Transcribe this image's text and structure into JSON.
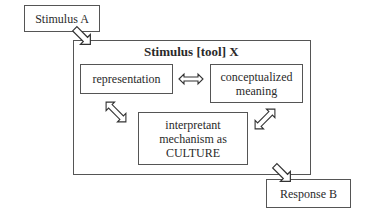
{
  "diagram": {
    "stimulus_a": "Stimulus A",
    "outer_title": "Stimulus [tool] X",
    "representation": "representation",
    "conceptualized_meaning": [
      "conceptualized",
      "meaning"
    ],
    "interpretant": [
      "interpretant",
      "mechanism as",
      "CULTURE"
    ],
    "response_b": "Response B"
  }
}
